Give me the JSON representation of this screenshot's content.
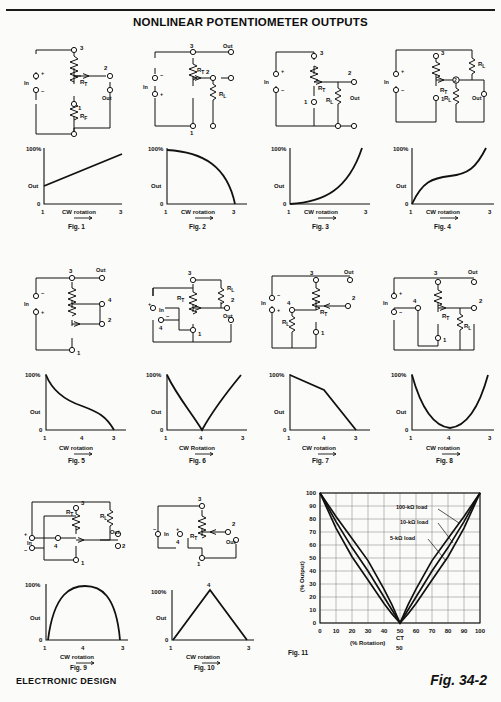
{
  "document": {
    "title": "NONLINEAR POTENTIOMETER OUTPUTS",
    "footer_left": "ELECTRONIC DESIGN",
    "footer_right": "Fig. 34-2"
  },
  "common": {
    "in_label": "In",
    "out_label": "Out",
    "plus": "+",
    "minus": "−",
    "rt": "R",
    "rt_sub": "T",
    "rl": "R",
    "rl_sub": "L",
    "y_top": "100%",
    "y_zero": "0",
    "y_out": "Out",
    "x_axis_label": "CW rotation",
    "x_axis_label_caps": "CW Rotation"
  },
  "figures": [
    {
      "id": "fig1",
      "caption": "Fig. 1",
      "terminals": [
        "3",
        "2",
        "1"
      ],
      "resistors": [
        "R_T",
        "R_F"
      ],
      "curve_name": "linear-rising",
      "x_ticks": [
        "1",
        "3"
      ],
      "x_axis_label": "CW rotation"
    },
    {
      "id": "fig2",
      "caption": "Fig. 2",
      "terminals": [
        "3",
        "2",
        "1"
      ],
      "resistors": [
        "R_T",
        "R_L"
      ],
      "curve_name": "quarter-circle-falling",
      "x_ticks": [
        "1",
        "3"
      ],
      "x_axis_label": "CW rotation"
    },
    {
      "id": "fig3",
      "caption": "Fig. 3",
      "terminals": [
        "3",
        "2",
        "1"
      ],
      "resistors": [
        "R_T",
        "R_L"
      ],
      "curve_name": "exponential-rising",
      "x_ticks": [
        "1",
        "3"
      ],
      "x_axis_label": "CW rotation"
    },
    {
      "id": "fig4",
      "caption": "Fig. 4",
      "terminals": [
        "3",
        "2",
        "1"
      ],
      "resistors": [
        "R_T",
        "R_L",
        "R_L"
      ],
      "curve_name": "s-curve-rising",
      "x_ticks": [
        "1",
        "3"
      ],
      "x_axis_label": "CW rotation"
    },
    {
      "id": "fig5",
      "caption": "Fig. 5",
      "terminals": [
        "3",
        "4",
        "2",
        "1"
      ],
      "resistors": [
        "R_T"
      ],
      "curve_name": "concave-falling",
      "x_ticks": [
        "1",
        "4",
        "3"
      ],
      "x_axis_label": "CW rotation"
    },
    {
      "id": "fig6",
      "caption": "Fig. 6",
      "terminals": [
        "3",
        "4",
        "2",
        "1"
      ],
      "resistors": [
        "R_T",
        "R_L"
      ],
      "curve_name": "v-notch",
      "x_ticks": [
        "1",
        "4",
        "3"
      ],
      "x_axis_label": "CW Rotation"
    },
    {
      "id": "fig7",
      "caption": "Fig. 7",
      "terminals": [
        "3",
        "4",
        "2",
        "1"
      ],
      "resistors": [
        "R_T",
        "R_L"
      ],
      "curve_name": "piecewise-falling",
      "x_ticks": [
        "1",
        "4",
        "3"
      ],
      "x_axis_label": "CW rotation"
    },
    {
      "id": "fig8",
      "caption": "Fig. 8",
      "terminals": [
        "3",
        "4",
        "2",
        "1"
      ],
      "resistors": [
        "R_T",
        "R_L"
      ],
      "curve_name": "u-curve",
      "x_ticks": [
        "1",
        "4",
        "3"
      ],
      "x_axis_label": "CW rotation"
    },
    {
      "id": "fig9",
      "caption": "Fig. 9",
      "terminals": [
        "3",
        "4",
        "2",
        "1"
      ],
      "resistors": [
        "R_T",
        "R_L"
      ],
      "curve_name": "dome-arch",
      "x_ticks": [
        "1",
        "4",
        "3"
      ],
      "x_axis_label": "CW rotation"
    },
    {
      "id": "fig10",
      "caption": "Fig. 10",
      "terminals": [
        "3",
        "4",
        "2",
        "1"
      ],
      "resistors": [
        "R_T"
      ],
      "curve_name": "triangle-peak",
      "x_ticks": [
        "1",
        "3"
      ],
      "peak_tick": "4",
      "x_axis_label": "CW rotation"
    }
  ],
  "chart_data": {
    "type": "line",
    "caption": "Fig. 11",
    "title": "",
    "xlabel": "(% Rotation)",
    "ylabel": "(% Output)",
    "xlim": [
      0,
      100
    ],
    "ylim": [
      0,
      100
    ],
    "x_ticks": [
      0,
      10,
      20,
      30,
      40,
      50,
      60,
      70,
      80,
      90,
      100
    ],
    "y_ticks": [
      0,
      10,
      20,
      30,
      40,
      50,
      60,
      70,
      80,
      90,
      100
    ],
    "grid": true,
    "center_tap": {
      "label": "CT",
      "value": "50"
    },
    "legend_position": "inside-upper-right",
    "series": [
      {
        "name": "100-kΩ load",
        "x": [
          0,
          10,
          20,
          30,
          40,
          45,
          50,
          55,
          60,
          70,
          80,
          90,
          100
        ],
        "values": [
          100,
          82,
          65,
          48,
          26,
          14,
          0,
          14,
          26,
          48,
          65,
          82,
          100
        ]
      },
      {
        "name": "10-kΩ load",
        "x": [
          0,
          10,
          20,
          30,
          40,
          45,
          50,
          55,
          60,
          70,
          80,
          90,
          100
        ],
        "values": [
          100,
          78,
          58,
          40,
          20,
          10,
          0,
          10,
          20,
          40,
          58,
          78,
          100
        ]
      },
      {
        "name": "5-kΩ load",
        "x": [
          0,
          10,
          20,
          30,
          40,
          45,
          50,
          55,
          60,
          70,
          80,
          90,
          100
        ],
        "values": [
          100,
          73,
          51,
          33,
          15,
          7,
          0,
          7,
          15,
          33,
          51,
          73,
          100
        ]
      }
    ]
  }
}
